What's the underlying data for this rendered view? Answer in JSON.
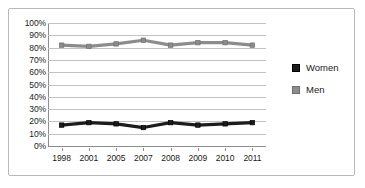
{
  "chart_data": {
    "type": "line",
    "title": "",
    "xlabel": "",
    "ylabel": "",
    "grid": "horizontal",
    "legend_position": "right",
    "categories": [
      "1998",
      "2001",
      "2005",
      "2007",
      "2008",
      "2009",
      "2010",
      "2011"
    ],
    "ylim": [
      0,
      100
    ],
    "ytick_step": 10,
    "ytick_labels": [
      "100%",
      "90%",
      "80%",
      "70%",
      "60%",
      "50%",
      "40%",
      "30%",
      "20%",
      "10%",
      "0%"
    ],
    "ytick_values": [
      100,
      90,
      80,
      70,
      60,
      50,
      40,
      30,
      20,
      10,
      0
    ],
    "series": [
      {
        "name": "Women",
        "color": "#1c1c1c",
        "marker": "square",
        "values": [
          17,
          19,
          18,
          15,
          19,
          17,
          18,
          19
        ]
      },
      {
        "name": "Men",
        "color": "#8c8c8c",
        "marker": "square",
        "values": [
          82,
          81,
          83,
          86,
          82,
          84,
          84,
          82
        ]
      }
    ]
  },
  "legend": {
    "entries": [
      {
        "label": "Women",
        "color": "#1c1c1c"
      },
      {
        "label": "Men",
        "color": "#8c8c8c"
      }
    ]
  },
  "colors": {
    "frame_border": "#b9b9b9",
    "gridline": "#c3c3c3",
    "axis": "#8d8d8d",
    "text": "#1a1a1a",
    "women": "#1c1c1c",
    "men": "#8c8c8c"
  }
}
